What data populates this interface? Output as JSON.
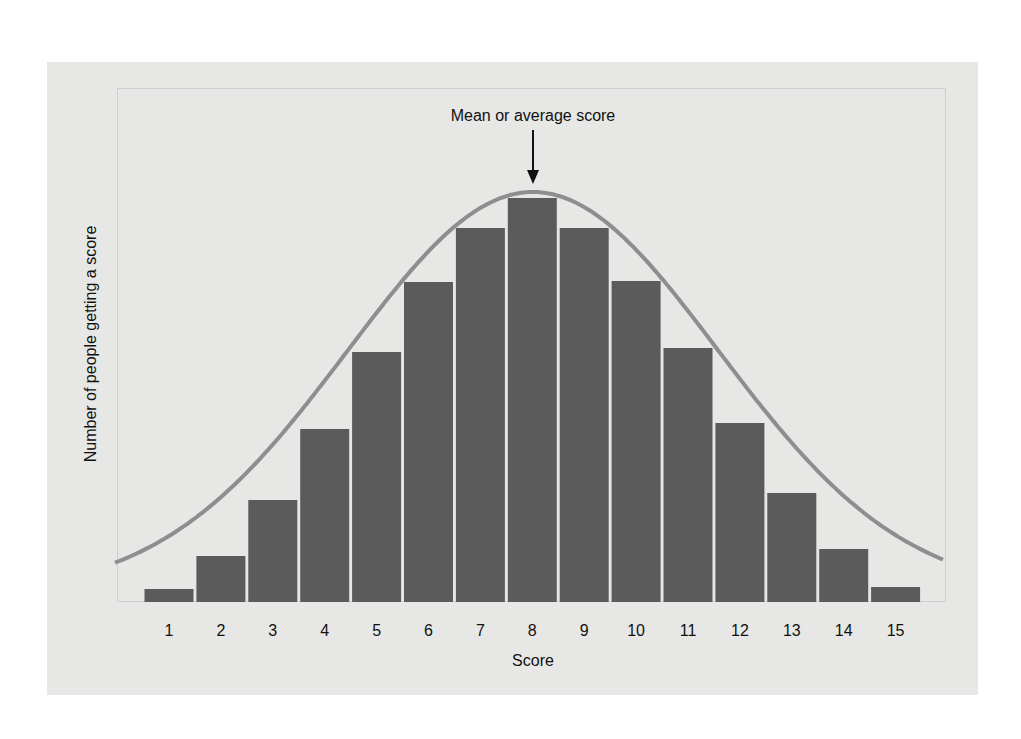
{
  "chart_data": {
    "type": "bar",
    "title": "",
    "annotation": "Mean or average score",
    "xlabel": "Score",
    "ylabel": "Number of people getting a score",
    "categories": [
      "1",
      "2",
      "3",
      "4",
      "5",
      "6",
      "7",
      "8",
      "9",
      "10",
      "11",
      "12",
      "13",
      "14",
      "15"
    ],
    "values": [
      13,
      46,
      102,
      173,
      250,
      320,
      374,
      404,
      374,
      321,
      254,
      179,
      109,
      53,
      15
    ],
    "value_units": "relative bar height (px above baseline, no numeric y-axis shown)",
    "overlay": {
      "type": "normal-curve",
      "peak_category": "8"
    },
    "ylim": [
      0,
      420
    ],
    "grid": false,
    "legend": null,
    "colors": {
      "bar": "#5b5b5b",
      "curve": "#8e8e8e",
      "panel": "#e7e7e6",
      "gap": "#ffffff"
    }
  }
}
